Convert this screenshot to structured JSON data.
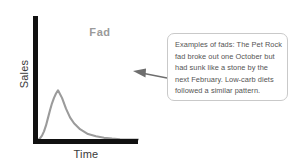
{
  "figure": {
    "background_color": "#ffffff",
    "title": "Fad",
    "title_color": "#9a9a9a",
    "axis_color": "#111111",
    "curve_color": "#9b9b9b"
  },
  "axes": {
    "ylabel": "Sales",
    "xlabel": "Time"
  },
  "callout": {
    "border_color": "#c9c9c9",
    "text_color": "#545454",
    "lines": [
      "Examples of fads: The Pet Rock",
      "fad broke out one October but",
      "had sunk like a stone by the",
      "next February. Low-carb diets",
      "followed a similar pattern."
    ],
    "full_text": "Examples of fads: The Pet Rock fad broke out one October but had sunk like a stone by the next February. Low-carb diets followed a similar pattern.",
    "pointer": "arrow-left"
  },
  "chart_data": {
    "type": "line",
    "title": "Fad",
    "xlabel": "Time",
    "ylabel": "Sales",
    "grid": false,
    "legend": null,
    "xlim": [
      0,
      100
    ],
    "ylim": [
      0,
      100
    ],
    "xticks": [],
    "yticks": [],
    "annotations": [
      {
        "text": "Examples of fads: The Pet Rock fad broke out one October but had sunk like a stone by the next February. Low-carb diets followed a similar pattern.",
        "points_to": "curve-decay-region"
      }
    ],
    "series": [
      {
        "name": "Fad",
        "color": "#9b9b9b",
        "x": [
          0,
          2,
          4,
          6,
          8,
          10,
          12,
          14,
          16,
          18,
          20,
          24,
          28,
          32,
          36,
          42,
          50,
          58,
          66,
          74,
          82,
          90,
          100
        ],
        "y": [
          0,
          3,
          8,
          16,
          27,
          41,
          55,
          68,
          78,
          86,
          92,
          78,
          58,
          42,
          31,
          20,
          11,
          7,
          4,
          2.5,
          1.5,
          1,
          0.8
        ]
      }
    ]
  }
}
